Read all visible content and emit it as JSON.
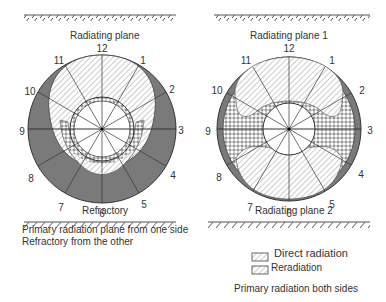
{
  "left_diagram": {
    "top_label": "Radiating plane",
    "bottom_label": "Refractory",
    "caption_line1": "Primary radiation plane from one side",
    "caption_line2": "Refractory from the other",
    "clock_positions": [
      "12",
      "1",
      "2",
      "3",
      "4",
      "5",
      "6",
      "7",
      "8",
      "9",
      "10",
      "11"
    ]
  },
  "right_diagram": {
    "top_label": "Radiating plane 1",
    "bottom_label": "Radiating plane 2",
    "caption": "Primary radiation both sides",
    "clock_positions": [
      "12",
      "1",
      "2",
      "3",
      "4",
      "5",
      "6",
      "7",
      "8",
      "9",
      "10",
      "11"
    ]
  },
  "legend": {
    "items": [
      {
        "label": "Direct radiation",
        "pattern": "diagonal-hatch"
      },
      {
        "label": "Reradiation",
        "pattern": "cross-hatch"
      }
    ]
  },
  "colors": {
    "shadow_fill": "#7a7a7a",
    "line": "#333333",
    "hatch": "#888888"
  }
}
